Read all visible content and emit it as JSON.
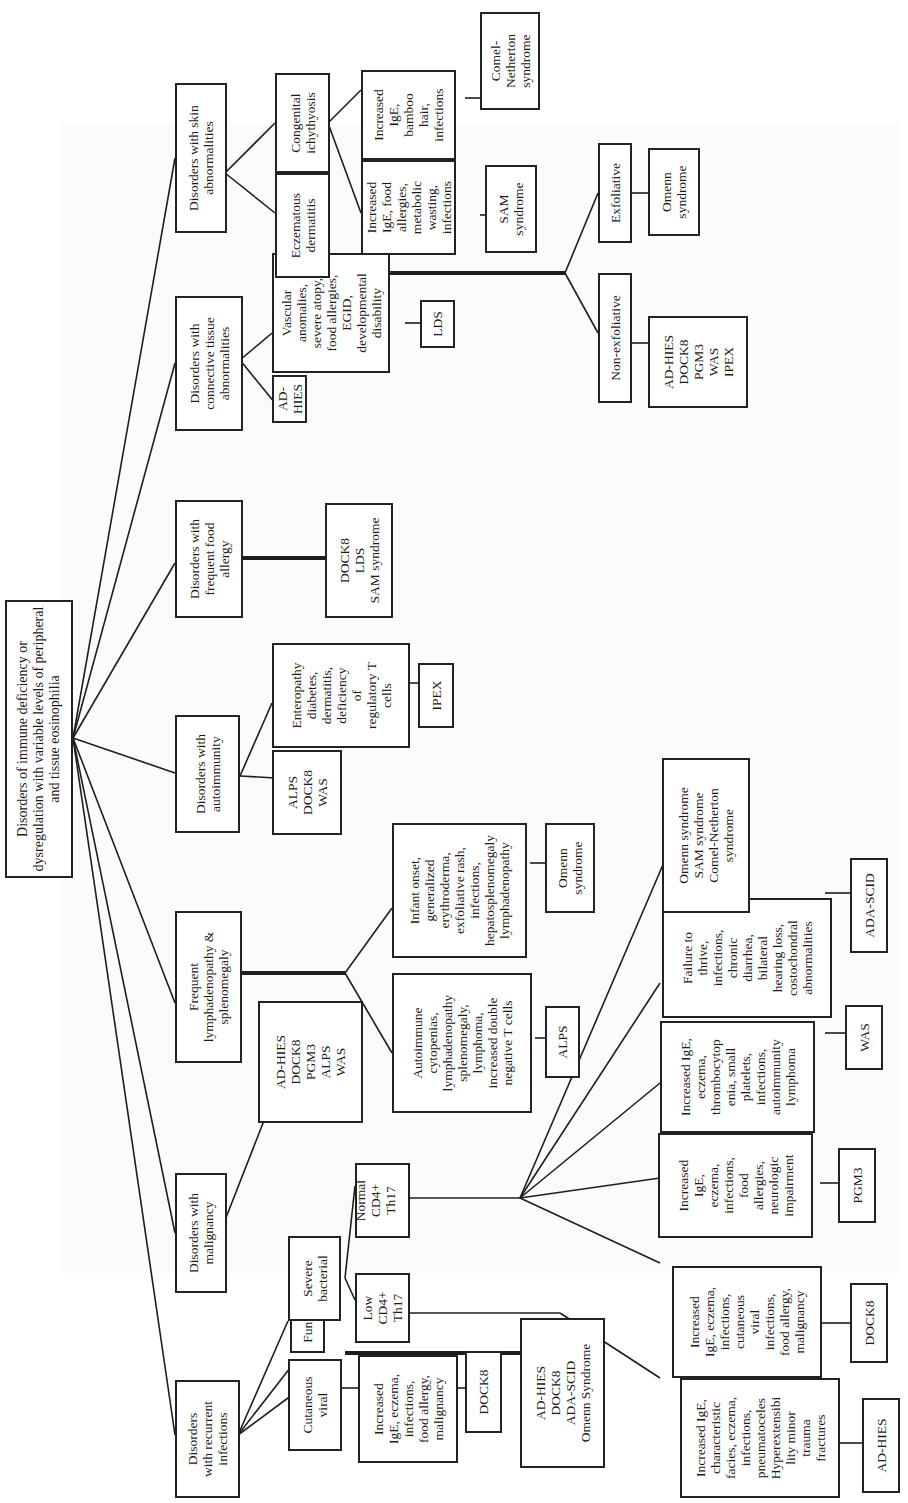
{
  "root": "Disorders of immune deficiency or\ndysregulation with variable levels of peripheral\nand tissue eosinophilia",
  "categories": {
    "recurrent_infections": "Disorders\nwith recurrent\ninfections",
    "malignancy": "Disorders with\nmalignancy",
    "lymphadenopathy": "Frequent\nlymphadenopathy &\nsplenomegaly",
    "autoimmunity": "Disorders with\nautoimmunity",
    "food_allergy": "Disorders with\nfrequent food\nallergy",
    "connective_tissue": "Disorders with\nconnective tissue\nabnormalities",
    "skin": "Disorders with skin\nabnormalities"
  },
  "infections": {
    "cutaneous_viral": "Cutaneous\nviral",
    "cutaneous_viral_features": "Increased\nIgE, eczema,\ninfections,\nfood allergy,\nmalignancy",
    "cutaneous_viral_dx": "DOCK8",
    "fungal": "Fungal",
    "fungal_dx": "AD-HIES\nDOCK8\nADA-SCID\nOmenn Syndrome",
    "severe_bacterial": "Severe\nbacterial",
    "low_th17": "Low\nCD4+\nTh17",
    "normal_th17": "Normal\nCD4+\nTh17\n..",
    "adhies_features": "Increased IgE,\ncharacteristic\nfacies, eczema,\ninfections,\npneumatoceles\nHyperextensibi\nlity minor\ntrauma\nfractures",
    "adhies_dx": "AD-HIES",
    "dock8_features": "Increased\nIgE, eczema,\ninfections,\ncutaneous\nviral\ninfections,\nfood allergy,\nmalignancy",
    "dock8_dx": "DOCK8",
    "pgm3_features": "Increased\nIgE,\neczema,\ninfections,\nfood\nallergies,\nneurologic\nimpairment",
    "pgm3_dx": "PGM3",
    "was_features": "Increased IgE,\neczema,\nthrombocytop\nenia, small\nplatelets,\ninfections,\nautoimmunity\nlymphoma",
    "was_dx": "WAS",
    "adascid_features": "Failure to\nthrive,\ninfections,\nchronic\ndiarrhea,\nbilateral\nhearing loss,\ncostochondral\nabnormalities",
    "adascid_dx": "ADA-SCID",
    "omenn_group_dx": "Omenn syndrome\nSAM syndrome\nComel-Netherton\nsyndrome"
  },
  "malignancy": {
    "dx": "AD-HIES\nDOCK8\nPGM3\nALPS\nWAS"
  },
  "lymphadenopathy": {
    "alps_features": "Autoimmune\ncytopenias,\nlymphadenopathy\nsplenomegaly,\nlymphoma,\nincreased double\nnegative T cells",
    "alps_dx": "ALPS",
    "omenn_features": "Infant onset,\ngeneralized\nerythroderma,\nexfoliative rash,\ninfections,\nhepatosplenomegaly\nlymphadenopathy",
    "omenn_dx": "Omenn\nsyndrome"
  },
  "autoimmunity": {
    "dx": "ALPS\nDOCK8\nWAS",
    "ipex_features": "Enteropathy\ndiabetes,\ndermatitis,\ndeficiency\nof\nregulatory T\ncells",
    "ipex_dx": "IPEX"
  },
  "food_allergy": {
    "dx": "DOCK8\nLDS\nSAM syndrome"
  },
  "connective_tissue": {
    "adhies": "AD-HIES",
    "lds_features": "Vascular\nanomalies,\nsevere atopy,\nfood allergies,\nEGID,\ndevelopmental\ndisability",
    "lds_dx": "LDS"
  },
  "skin": {
    "eczematous": "Eczematous\ndermatitis",
    "ichthyosis": "Congenital\nichythyosis",
    "sam_features": "Increased\nIgE, food\nallergies,\nmetabolic\nwasting,\ninfections",
    "sam_dx": "SAM\nsyndrome",
    "comel_features": "Increased\nIgE,\nbamboo\nhair,\ninfections",
    "comel_dx": "Comel-\nNetherton\nsyndrome",
    "non_exfoliative": "Non-exfoliative",
    "non_exfoliative_dx": "AD-HIES\nDOCK8\nPGM3\nWAS\nIPEX",
    "exfoliative": "Exfoliative",
    "exfoliative_dx": "Omenn\nsyndrome"
  }
}
